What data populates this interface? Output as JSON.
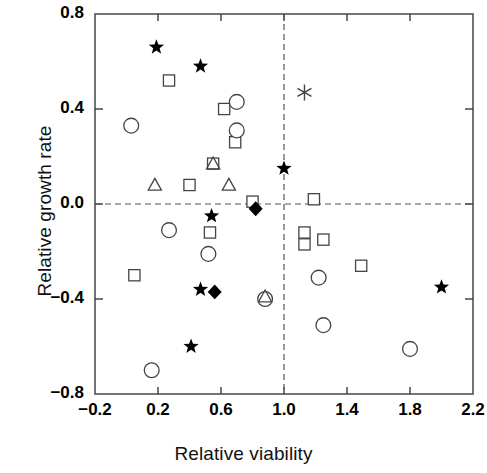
{
  "chart_data": {
    "type": "scatter",
    "title": "",
    "xlabel": "Relative viability",
    "ylabel": "Relative growth rate",
    "xlim": [
      -0.2,
      2.2
    ],
    "ylim": [
      -0.8,
      0.8
    ],
    "xticks": [
      -0.2,
      0.2,
      0.6,
      1.0,
      1.4,
      1.8,
      2.2
    ],
    "yticks": [
      -0.8,
      -0.4,
      0.0,
      0.4,
      0.8
    ],
    "xtick_labels": [
      "−0.2",
      "0.2",
      "0.6",
      "1.0",
      "1.4",
      "1.8",
      "2.2"
    ],
    "ytick_labels": [
      "−0.8",
      "−0.4",
      "0.0",
      "0.4",
      "0.8"
    ],
    "grid": false,
    "legend": "none",
    "reference_lines": [
      {
        "axis": "y",
        "value": 0.0,
        "style": "dashed"
      },
      {
        "axis": "x",
        "value": 1.0,
        "style": "dashed"
      }
    ],
    "marker_types": [
      "filled-star",
      "open-square",
      "open-circle",
      "open-triangle",
      "filled-diamond",
      "asterisk"
    ],
    "series": [
      {
        "name": "filled-star",
        "marker": "filled-star",
        "points": [
          {
            "x": 0.19,
            "y": 0.66
          },
          {
            "x": 0.47,
            "y": 0.58
          },
          {
            "x": 1.0,
            "y": 0.15
          },
          {
            "x": 0.54,
            "y": -0.05
          },
          {
            "x": 0.47,
            "y": -0.36
          },
          {
            "x": 0.41,
            "y": -0.6
          },
          {
            "x": 2.0,
            "y": -0.35
          }
        ]
      },
      {
        "name": "open-square",
        "marker": "open-square",
        "points": [
          {
            "x": 0.27,
            "y": 0.52
          },
          {
            "x": 0.62,
            "y": 0.4
          },
          {
            "x": 0.69,
            "y": 0.26
          },
          {
            "x": 0.55,
            "y": 0.17
          },
          {
            "x": 0.4,
            "y": 0.08
          },
          {
            "x": 0.8,
            "y": 0.01
          },
          {
            "x": 1.19,
            "y": 0.02
          },
          {
            "x": 0.53,
            "y": -0.12
          },
          {
            "x": 0.05,
            "y": -0.3
          },
          {
            "x": 1.25,
            "y": -0.15
          },
          {
            "x": 1.13,
            "y": -0.12
          },
          {
            "x": 1.13,
            "y": -0.17
          },
          {
            "x": 1.49,
            "y": -0.26
          }
        ]
      },
      {
        "name": "open-circle",
        "marker": "open-circle",
        "points": [
          {
            "x": 0.03,
            "y": 0.33
          },
          {
            "x": 0.7,
            "y": 0.43
          },
          {
            "x": 0.7,
            "y": 0.31
          },
          {
            "x": 0.27,
            "y": -0.11
          },
          {
            "x": 0.52,
            "y": -0.21
          },
          {
            "x": 0.88,
            "y": -0.4
          },
          {
            "x": 1.22,
            "y": -0.31
          },
          {
            "x": 1.25,
            "y": -0.51
          },
          {
            "x": 1.8,
            "y": -0.61
          },
          {
            "x": 0.16,
            "y": -0.7
          }
        ]
      },
      {
        "name": "open-triangle",
        "marker": "open-triangle",
        "points": [
          {
            "x": 0.55,
            "y": 0.17
          },
          {
            "x": 0.18,
            "y": 0.08
          },
          {
            "x": 0.65,
            "y": 0.08
          },
          {
            "x": 0.88,
            "y": -0.39
          }
        ]
      },
      {
        "name": "filled-diamond",
        "marker": "filled-diamond",
        "points": [
          {
            "x": 0.82,
            "y": -0.02
          },
          {
            "x": 0.56,
            "y": -0.37
          }
        ]
      },
      {
        "name": "asterisk",
        "marker": "asterisk",
        "points": [
          {
            "x": 1.13,
            "y": 0.47
          }
        ]
      }
    ]
  },
  "axes": {
    "x_title": "Relative viability",
    "y_title": "Relative growth rate"
  }
}
